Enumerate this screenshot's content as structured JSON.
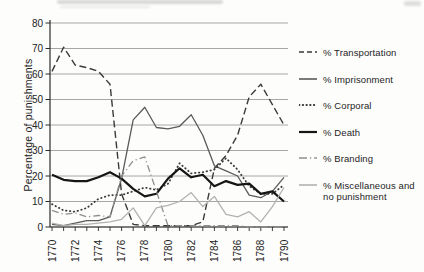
{
  "chart_data": {
    "type": "line",
    "title": "",
    "xlabel": "",
    "ylabel": "Percentage of punishments",
    "x": [
      1770,
      1771,
      1772,
      1773,
      1774,
      1775,
      1776,
      1777,
      1778,
      1779,
      1780,
      1781,
      1782,
      1783,
      1784,
      1785,
      1786,
      1787,
      1788,
      1789,
      1790
    ],
    "xtick_labels": [
      "1770",
      "1772",
      "1774",
      "1776",
      "1778",
      "1780",
      "1782",
      "1784",
      "1786",
      "1788",
      "1790"
    ],
    "ylim": [
      0,
      80
    ],
    "yticks": [
      0,
      10,
      20,
      30,
      40,
      50,
      60,
      70,
      80
    ],
    "grid": "horizontal",
    "grid_color": "#8f8f8f",
    "axis_color": "#2a2a2a",
    "legend_position": "right",
    "series": [
      {
        "name": "% Transportation",
        "style": "dashed",
        "color": "#3a3a3a",
        "values": [
          61,
          70.5,
          63.5,
          62.5,
          61,
          56,
          13,
          1,
          0.5,
          0.5,
          0.5,
          0.5,
          0.5,
          2,
          23,
          28,
          36,
          51,
          56,
          48,
          40
        ]
      },
      {
        "name": "% Imprisonment",
        "style": "solid",
        "color": "#5a5a5a",
        "values": [
          1,
          0.5,
          1.5,
          2.5,
          2.5,
          4,
          19,
          42,
          47,
          39,
          38.5,
          39.5,
          44,
          36,
          24,
          22,
          20,
          12.5,
          11.5,
          14,
          19.5
        ]
      },
      {
        "name": "% Corporal",
        "style": "dotted",
        "color": "#3a3a3a",
        "values": [
          9,
          6.5,
          6,
          7.5,
          11,
          12.5,
          12.5,
          14,
          15.5,
          14.5,
          17,
          25,
          21,
          21.5,
          22.5,
          27,
          22.5,
          16,
          13,
          13,
          16.5
        ]
      },
      {
        "name": "% Death",
        "style": "solid-thick",
        "color": "#161616",
        "values": [
          20.5,
          18.5,
          18,
          18,
          19.5,
          21.5,
          19,
          15,
          12,
          13,
          19,
          23,
          19.5,
          20.5,
          16,
          18,
          16.5,
          17,
          13,
          14,
          10
        ]
      },
      {
        "name": "% Branding",
        "style": "dash-dot",
        "color": "#8e8e8e",
        "values": [
          6.5,
          5,
          5.5,
          4,
          4.5,
          4,
          20,
          26,
          27.5,
          14,
          0.5,
          0.5,
          0.5,
          0.5,
          0.5,
          0.5,
          0.5,
          0,
          0,
          0,
          0
        ]
      },
      {
        "name": "% Miscellaneous and no punishment",
        "style": "solid",
        "color": "#b2b2b2",
        "values": [
          1.5,
          0.5,
          1,
          1,
          1.5,
          2,
          3,
          7.5,
          0.5,
          7.5,
          8.5,
          10,
          13.5,
          8,
          12,
          5,
          4,
          6,
          2,
          8,
          15.5
        ]
      }
    ]
  }
}
